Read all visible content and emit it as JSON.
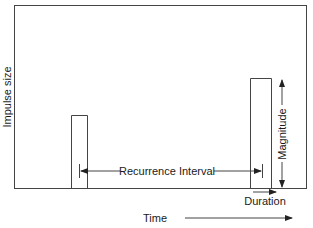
{
  "diagram": {
    "y_axis_label": "Impulse size",
    "x_axis_label": "Time",
    "annotations": {
      "recurrence": "Recurrence Interval",
      "magnitude": "Magnitude",
      "duration": "Duration"
    },
    "pulses": [
      {
        "name": "first-impulse",
        "x_start": 71,
        "x_end": 87,
        "top": 115
      },
      {
        "name": "second-impulse",
        "x_start": 250,
        "x_end": 271,
        "top": 78
      }
    ],
    "colors": {
      "line": "#333333",
      "background": "#ffffff"
    }
  }
}
